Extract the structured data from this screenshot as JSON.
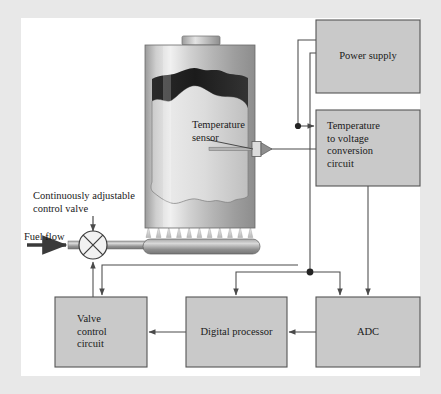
{
  "figure": {
    "background_color": "#e8e8e8",
    "panel_color": "#ffffff",
    "box_fill": "#c9c9c9",
    "box_border": "#555555",
    "line_color": "#4a4a4a",
    "text_color": "#1a1a1a"
  },
  "blocks": [
    {
      "id": "power-supply",
      "label": "Power supply",
      "align": "center",
      "x": 316,
      "y": 20,
      "width": 104,
      "height": 73
    },
    {
      "id": "temperature-to-voltage",
      "label": "Temperature\nto voltage\nconversion\ncircuit",
      "align": "left",
      "x": 316,
      "y": 110,
      "width": 104,
      "height": 76
    },
    {
      "id": "valve-control-circuit",
      "label": "Valve\ncontrol\ncircuit",
      "align": "left",
      "x": 55,
      "y": 297,
      "width": 92,
      "height": 70
    },
    {
      "id": "digital-processor",
      "label": "Digital processor",
      "align": "center",
      "x": 186,
      "y": 297,
      "width": 101,
      "height": 70
    },
    {
      "id": "adc",
      "label": "ADC",
      "align": "center",
      "x": 316,
      "y": 297,
      "width": 104,
      "height": 70
    }
  ],
  "annotations": {
    "temperature_sensor": "Temperature\nsensor",
    "control_valve": "Continuously adjustable\ncontrol valve",
    "fuel_flow": "Fuel flow"
  },
  "components": {
    "tank": {
      "name": "heated-tank",
      "x": 145,
      "y": 45,
      "width": 110,
      "height": 183
    },
    "tank_cap": {
      "x": 182,
      "y": 38,
      "width": 38,
      "height": 8
    },
    "burner": {
      "x": 143,
      "y": 240,
      "width": 117,
      "height": 14,
      "flame_count": 11
    },
    "valve": {
      "cx": 93,
      "cy": 245,
      "r": 14
    },
    "sensor_probe": {
      "x1": 209,
      "x2": 262,
      "y": 149
    }
  },
  "junction_dots": [
    {
      "x": 298,
      "y": 126
    },
    {
      "x": 310,
      "y": 272
    }
  ]
}
